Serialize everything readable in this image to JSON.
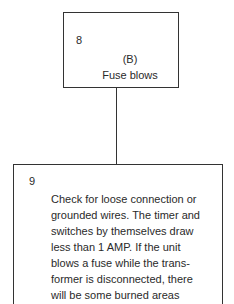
{
  "nodes": [
    {
      "id": "8",
      "number": "8",
      "label": "(B)",
      "text": "Fuse blows"
    },
    {
      "id": "9",
      "number": "9",
      "text": "Check for loose connection or\ngrounded wires. The timer and\nswitches by themselves draw\nless than 1 AMP. If the unit\nblows a fuse while the trans-\nformer is disconnected, there\nwill be some burned areas"
    }
  ],
  "edges": [
    {
      "from": "8",
      "to": "9"
    }
  ]
}
